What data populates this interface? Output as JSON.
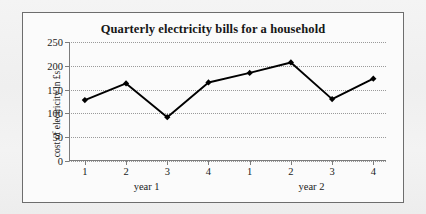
{
  "chart_data": {
    "type": "line",
    "title": "Quarterly electricity bills for a household",
    "xlabel": "",
    "ylabel": "cost of electricity in £s",
    "categories": [
      "1",
      "2",
      "3",
      "4",
      "1",
      "2",
      "3",
      "4"
    ],
    "values": [
      128,
      163,
      92,
      165,
      185,
      207,
      130,
      173
    ],
    "group_labels": [
      "year 1",
      "year 2"
    ],
    "yticks": [
      0,
      50,
      100,
      150,
      200,
      250
    ],
    "ylim": [
      0,
      250
    ],
    "grid": true,
    "legend": "none",
    "marker": "diamond",
    "series_color": "#000000"
  },
  "frame": {
    "border_color": "#6d6d6d",
    "background": "#fbfbfb"
  }
}
